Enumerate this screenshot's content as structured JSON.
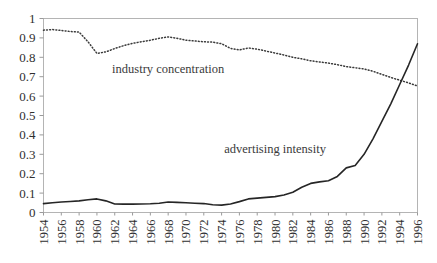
{
  "chart_data": {
    "type": "line",
    "title": "",
    "xlabel": "",
    "ylabel": "",
    "xlim": [
      1954,
      1996
    ],
    "ylim": [
      0,
      1
    ],
    "grid": false,
    "legend_position": "inline-annotations",
    "ytick_labels": [
      "1",
      "0.9",
      "0.8",
      "0.7",
      "0.6",
      "0.5",
      "0.4",
      "0.3",
      "0.2",
      "0.1",
      "0"
    ],
    "ytick_values": [
      1,
      0.9,
      0.8,
      0.7,
      0.6,
      0.5,
      0.4,
      0.3,
      0.2,
      0.1,
      0
    ],
    "xtick_labels": [
      "1954",
      "1956",
      "1958",
      "1960",
      "1962",
      "1964",
      "1966",
      "1968",
      "1970",
      "1972",
      "1974",
      "1976",
      "1978",
      "1980",
      "1982",
      "1984",
      "1986",
      "1988",
      "1990",
      "1992",
      "1994",
      "1996"
    ],
    "xtick_values": [
      1954,
      1956,
      1958,
      1960,
      1962,
      1964,
      1966,
      1968,
      1970,
      1972,
      1974,
      1976,
      1978,
      1980,
      1982,
      1984,
      1986,
      1988,
      1990,
      1992,
      1994,
      1996
    ],
    "x": [
      1954,
      1955,
      1956,
      1957,
      1958,
      1959,
      1960,
      1961,
      1962,
      1963,
      1964,
      1965,
      1966,
      1967,
      1968,
      1969,
      1970,
      1971,
      1972,
      1973,
      1974,
      1975,
      1976,
      1977,
      1978,
      1979,
      1980,
      1981,
      1982,
      1983,
      1984,
      1985,
      1986,
      1987,
      1988,
      1989,
      1990,
      1991,
      1992,
      1993,
      1994,
      1995,
      1996
    ],
    "series": [
      {
        "name": "industry concentration",
        "style": "dotted",
        "color": "#3a3a3a",
        "label_x": 1968,
        "label_y": 0.72,
        "values": [
          0.94,
          0.943,
          0.938,
          0.933,
          0.93,
          0.88,
          0.82,
          0.828,
          0.845,
          0.86,
          0.872,
          0.88,
          0.888,
          0.898,
          0.905,
          0.898,
          0.888,
          0.884,
          0.88,
          0.878,
          0.87,
          0.846,
          0.838,
          0.848,
          0.842,
          0.832,
          0.822,
          0.812,
          0.8,
          0.792,
          0.782,
          0.776,
          0.77,
          0.762,
          0.752,
          0.746,
          0.74,
          0.728,
          0.712,
          0.696,
          0.682,
          0.668,
          0.652
        ]
      },
      {
        "name": "advertising intensity",
        "style": "solid",
        "color": "#262626",
        "label_x": 1980,
        "label_y": 0.305,
        "values": [
          0.046,
          0.05,
          0.054,
          0.057,
          0.06,
          0.066,
          0.07,
          0.06,
          0.044,
          0.043,
          0.043,
          0.044,
          0.045,
          0.048,
          0.054,
          0.052,
          0.05,
          0.048,
          0.046,
          0.04,
          0.038,
          0.044,
          0.056,
          0.07,
          0.074,
          0.078,
          0.082,
          0.09,
          0.104,
          0.13,
          0.15,
          0.158,
          0.164,
          0.186,
          0.23,
          0.242,
          0.3,
          0.38,
          0.47,
          0.56,
          0.66,
          0.76,
          0.87
        ]
      }
    ],
    "annotations": [
      {
        "text": "industry concentration",
        "x": 1968,
        "y": 0.72
      },
      {
        "text": "advertising intensity",
        "x": 1980,
        "y": 0.305
      }
    ]
  },
  "figure": {
    "background": "#ffffff",
    "frame_color": "#b4b4b4"
  }
}
